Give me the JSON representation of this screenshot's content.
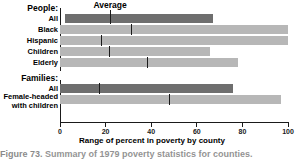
{
  "chart_data": {
    "type": "bar",
    "title": "",
    "xlabel": "Range of percent in poverty by county",
    "ylabel": "",
    "xlim": [
      0,
      100
    ],
    "xticks": [
      0,
      20,
      40,
      60,
      80,
      100
    ],
    "grid": false,
    "legend": "none",
    "orientation": "horizontal",
    "annotation": "Average",
    "annotation_value": 22,
    "groups": [
      {
        "label": "People:",
        "rows": [
          {
            "label": "All",
            "min": 2,
            "max": 67,
            "average": 22,
            "shade": "dark"
          },
          {
            "label": "Black",
            "min": 0,
            "max": 100,
            "average": 31.5,
            "shade": "light"
          },
          {
            "label": "Hispanic",
            "min": 0,
            "max": 100,
            "average": 18,
            "shade": "light"
          },
          {
            "label": "Children",
            "min": 0,
            "max": 66,
            "average": 21.5,
            "shade": "light"
          },
          {
            "label": "Elderly",
            "min": 0,
            "max": 78,
            "average": 38.5,
            "shade": "light"
          }
        ]
      },
      {
        "label": "Families:",
        "rows": [
          {
            "label": "All",
            "min": 0,
            "max": 76,
            "average": 17.5,
            "shade": "dark"
          },
          {
            "label": "Female-headed\nwith children",
            "min": 0,
            "max": 97,
            "average": 48,
            "shade": "light"
          }
        ]
      }
    ]
  },
  "axis": {
    "tick_0": "0",
    "tick_20": "20",
    "tick_40": "40",
    "tick_60": "60",
    "tick_80": "80",
    "tick_100": "100",
    "title": "Range of percent in poverty by county"
  },
  "labels": {
    "people_group": "People:",
    "people_all": "All",
    "people_black": "Black",
    "people_hispanic": "Hispanic",
    "people_children": "Children",
    "people_elderly": "Elderly",
    "families_group": "Families:",
    "families_all": "All",
    "families_female_line1": "Female-headed",
    "families_female_line2": "with children",
    "average": "Average"
  },
  "caption": {
    "figure_number": "Figure 73.",
    "text": "Summary of 1979 poverty statistics for counties."
  },
  "colors": {
    "bar_light": "#b7b7b7",
    "bar_dark": "#6e6e6e",
    "axis": "#1a1a1a",
    "text": "#000000",
    "background": "#ffffff"
  }
}
